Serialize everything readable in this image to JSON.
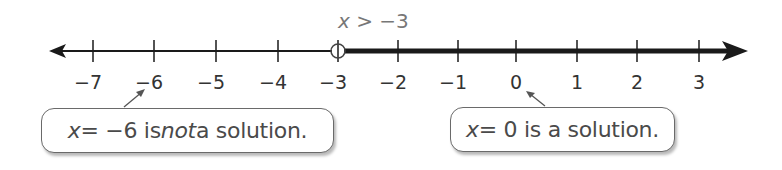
{
  "inequality": {
    "var": "x",
    "op": " > ",
    "value": "−3"
  },
  "number_line": {
    "ticks": [
      {
        "label": "−7",
        "x": 93
      },
      {
        "label": "−6",
        "x": 154
      },
      {
        "label": "−5",
        "x": 216
      },
      {
        "label": "−4",
        "x": 278
      },
      {
        "label": "−3",
        "x": 338
      },
      {
        "label": "−2",
        "x": 398
      },
      {
        "label": "−1",
        "x": 458
      },
      {
        "label": "0",
        "x": 516
      },
      {
        "label": "1",
        "x": 577
      },
      {
        "label": "2",
        "x": 637
      },
      {
        "label": "3",
        "x": 699
      }
    ],
    "open_circle_at": "−3",
    "shaded_direction": "right"
  },
  "callouts": [
    {
      "var": "x",
      "eq": " = −6 is ",
      "emph": "not",
      "rest": " a solution."
    },
    {
      "var": "x",
      "eq": " = 0 is a solution."
    }
  ],
  "colors": {
    "line": "#1a1a1a",
    "text": "#4a4a4a",
    "callout_border": "#6a6a6a"
  }
}
